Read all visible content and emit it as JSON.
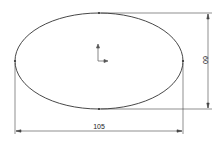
{
  "drawing": {
    "type": "ellipse-sketch",
    "ellipse": {
      "cx": 99,
      "cy": 61,
      "rx": 84,
      "ry": 48,
      "stroke": "#333333"
    },
    "dimensions": {
      "width_label": "105",
      "height_label": "60"
    },
    "origin_icon": "coordinate-axes-icon"
  }
}
